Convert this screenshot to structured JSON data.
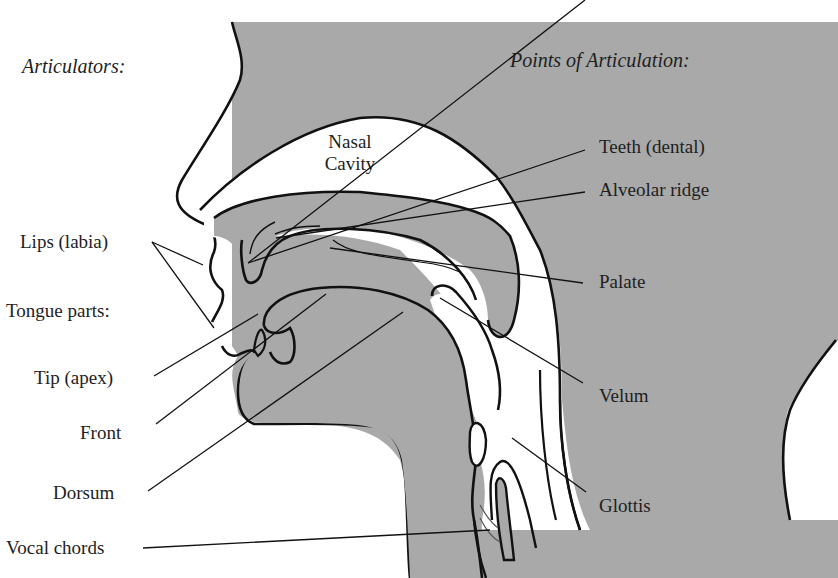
{
  "headings": {
    "articulators": "Articulators:",
    "points_of_articulation": "Points of Articulation:"
  },
  "cavity": {
    "line1": "Nasal",
    "line2": "Cavity"
  },
  "articulators": {
    "lips": "Lips (labia)",
    "tongue_parts": "Tongue parts:",
    "tip": "Tip (apex)",
    "front": "Front",
    "dorsum": "Dorsum",
    "vocal_chords": "Vocal chords"
  },
  "points": {
    "teeth": "Teeth (dental)",
    "alveolar": "Alveolar ridge",
    "palate": "Palate",
    "velum": "Velum",
    "glottis": "Glottis"
  },
  "colors": {
    "tissue_gray": "#a9a9a9",
    "outline": "#111111",
    "background": "#ffffff",
    "text": "#1e1e1e"
  }
}
